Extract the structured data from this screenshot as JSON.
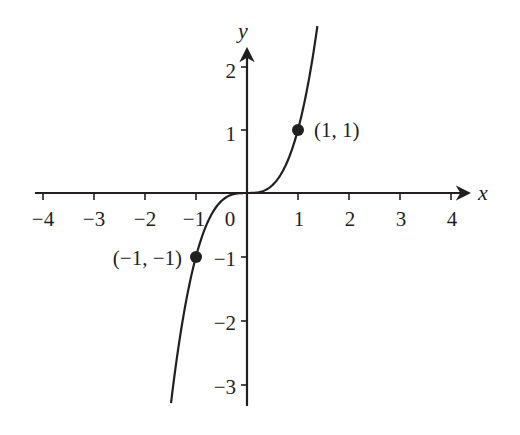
{
  "chart_data": {
    "type": "line",
    "title": "",
    "function": "y = x^3",
    "xlabel": "x",
    "ylabel": "y",
    "xlim": [
      -4.2,
      4.4
    ],
    "ylim": [
      -3.35,
      2.3
    ],
    "x_ticks": [
      -4,
      -3,
      -2,
      -1,
      0,
      1,
      2,
      3,
      4
    ],
    "x_tick_labels": [
      "−4",
      "−3",
      "−2",
      "−1",
      "0",
      "1",
      "2",
      "3",
      "4"
    ],
    "y_ticks": [
      -3,
      -2,
      -1,
      1,
      2
    ],
    "y_tick_labels": [
      "−3",
      "−2",
      "−1",
      "1",
      "2"
    ],
    "grid": false,
    "series": [
      {
        "name": "y = x^3",
        "x": [
          -1.49,
          -1.25,
          -1.0,
          -0.75,
          -0.5,
          -0.25,
          0,
          0.25,
          0.5,
          0.75,
          1.0,
          1.25,
          1.38
        ],
        "y": [
          -3.31,
          -1.95,
          -1.0,
          -0.42,
          -0.125,
          -0.016,
          0,
          0.016,
          0.125,
          0.42,
          1.0,
          1.95,
          2.63
        ]
      }
    ],
    "points": [
      {
        "x": 1,
        "y": 1,
        "label": "(1, 1)"
      },
      {
        "x": -1,
        "y": -1,
        "label": "(−1, −1)"
      }
    ],
    "colors": {
      "ink": "#231f20",
      "background": "#ffffff"
    }
  }
}
